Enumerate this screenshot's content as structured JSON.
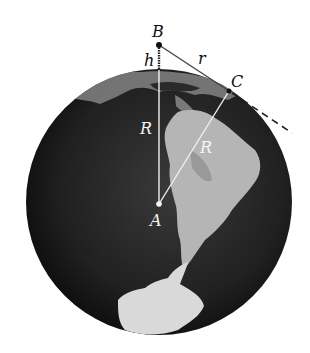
{
  "diagram": {
    "type": "geometry-earth-horizon",
    "labels": {
      "B": "B",
      "h": "h",
      "r": "r",
      "C": "C",
      "R_vertical": "R",
      "R_diagonal": "R",
      "A": "A"
    },
    "points": {
      "A": {
        "x": 159,
        "y": 204,
        "description": "center of Earth"
      },
      "B": {
        "x": 159,
        "y": 45,
        "description": "observer at height h"
      },
      "C": {
        "x": 229,
        "y": 91,
        "description": "tangent point on horizon"
      }
    },
    "segments": [
      {
        "from": "A",
        "to": "B",
        "label": "R + h",
        "parts": [
          "R",
          "h"
        ]
      },
      {
        "from": "A",
        "to": "C",
        "label": "R"
      },
      {
        "from": "B",
        "to": "C",
        "label": "r",
        "extended_dashed": true
      }
    ],
    "colors": {
      "globe": "#1c1c1c",
      "land": "#b8b8b8",
      "lines_on_globe": "#f0f0f0",
      "lines_off_globe": "#333333",
      "label_on_globe": "#f5f5f5",
      "label_off_globe": "#111111"
    }
  }
}
